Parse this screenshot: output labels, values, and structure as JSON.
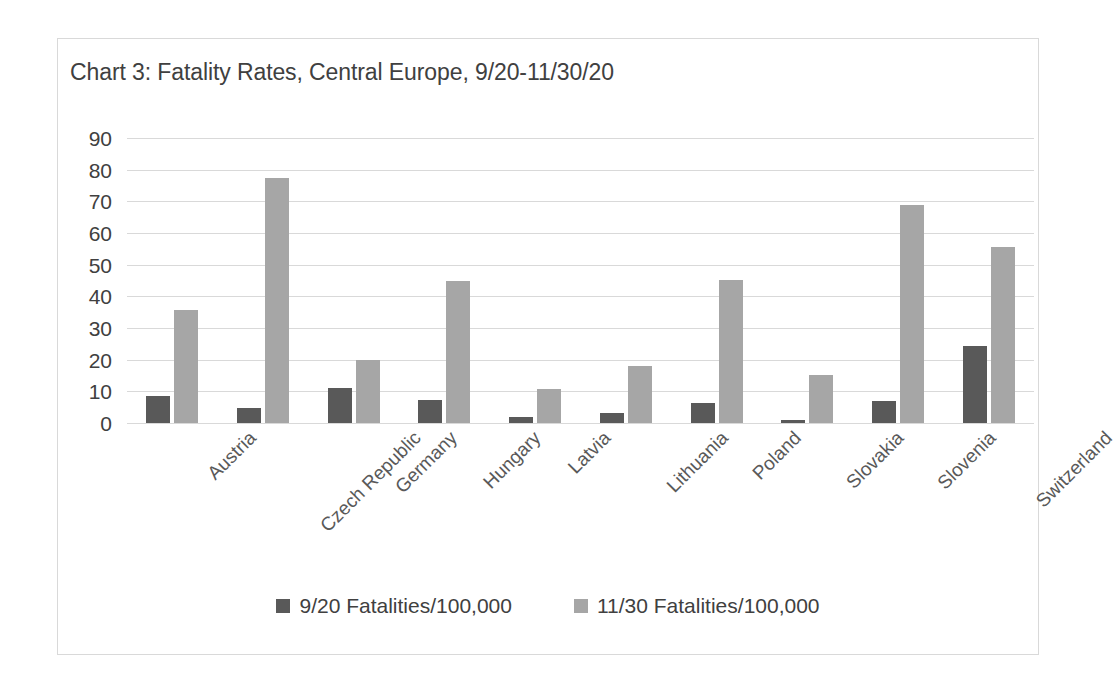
{
  "chart_data": {
    "type": "bar",
    "title": "Chart 3: Fatality Rates, Central Europe, 9/20-11/30/20",
    "xlabel": "",
    "ylabel": "",
    "ylim": [
      0,
      90
    ],
    "ytick_step": 10,
    "yticks": [
      "90",
      "80",
      "70",
      "60",
      "50",
      "40",
      "30",
      "20",
      "10",
      "0"
    ],
    "grid": true,
    "legend_position": "bottom",
    "categories": [
      "Austria",
      "Czech Republic",
      "Germany",
      "Hungary",
      "Latvia",
      "Lithuania",
      "Poland",
      "Slovakia",
      "Slovenia",
      "Switzerland"
    ],
    "series": [
      {
        "name": "9/20 Fatalities/100,000",
        "color": "#595959",
        "values": [
          8.4,
          4.8,
          11.0,
          7.3,
          2.0,
          3.2,
          6.2,
          0.8,
          6.8,
          24.2
        ]
      },
      {
        "name": "11/30 Fatalities/100,000",
        "color": "#a6a6a6",
        "values": [
          35.7,
          77.5,
          20.0,
          45.0,
          10.7,
          18.0,
          45.2,
          15.2,
          69.0,
          55.6
        ]
      }
    ]
  },
  "colors": {
    "series_dark": "#595959",
    "series_light": "#a6a6a6",
    "gridline": "#d9d9d9",
    "border": "#d9d9d9",
    "title_text": "#404040",
    "axis_text": "#595959",
    "background": "#ffffff"
  }
}
